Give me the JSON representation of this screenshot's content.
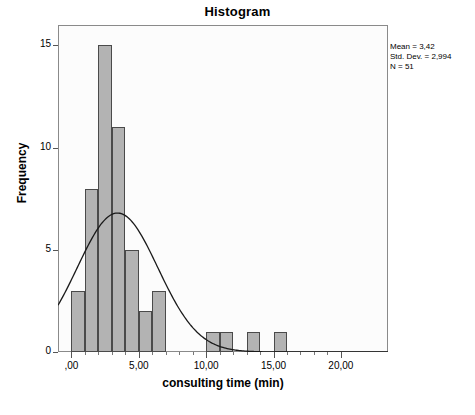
{
  "chart_data": {
    "type": "bar",
    "title": "Histogram",
    "xlabel": "consulting time (min)",
    "ylabel": "Frequency",
    "xlim": [
      -1.0,
      23.5
    ],
    "ylim": [
      0,
      16
    ],
    "grid": false,
    "bin_width": 1,
    "categories": [
      "0",
      "1",
      "2",
      "3",
      "4",
      "5",
      "6",
      "10",
      "11",
      "13",
      "15"
    ],
    "bins": [
      {
        "left": 0,
        "right": 1,
        "value": 3
      },
      {
        "left": 1,
        "right": 2,
        "value": 8
      },
      {
        "left": 2,
        "right": 3,
        "value": 15
      },
      {
        "left": 3,
        "right": 4,
        "value": 11
      },
      {
        "left": 4,
        "right": 5,
        "value": 5
      },
      {
        "left": 5,
        "right": 6,
        "value": 2
      },
      {
        "left": 6,
        "right": 7,
        "value": 3
      },
      {
        "left": 10,
        "right": 11,
        "value": 1
      },
      {
        "left": 11,
        "right": 12,
        "value": 1
      },
      {
        "left": 13,
        "right": 14,
        "value": 1
      },
      {
        "left": 15,
        "right": 16,
        "value": 1
      }
    ],
    "values": [
      3,
      8,
      15,
      11,
      5,
      2,
      3,
      1,
      1,
      1,
      1
    ],
    "xticks": [
      {
        "value": 0,
        "label": ",00"
      },
      {
        "value": 5,
        "label": "5,00"
      },
      {
        "value": 10,
        "label": "10,00"
      },
      {
        "value": 15,
        "label": "15,00"
      },
      {
        "value": 20,
        "label": "20,00"
      }
    ],
    "xminor_ticks": [
      1,
      2,
      3,
      4,
      6,
      7,
      8,
      9,
      11,
      12,
      13,
      14,
      16,
      17,
      18,
      19
    ],
    "yticks": [
      {
        "value": 0,
        "label": "0"
      },
      {
        "value": 5,
        "label": "5"
      },
      {
        "value": 10,
        "label": "10"
      },
      {
        "value": 15,
        "label": "15"
      }
    ],
    "normal_curve": {
      "mean": 3.42,
      "std_dev": 2.994,
      "n": 51,
      "peak_height": 6.8,
      "shown": true
    },
    "colors": {
      "bar_fill": "#b3b3b3",
      "bar_border": "#4a4a4a",
      "curve": "#1a1a1a",
      "plot_border": "#8a8a8a",
      "plot_background": "#fcfcfc"
    }
  },
  "stats": {
    "mean_line": "Mean = 3,42",
    "std_dev_line": "Std. Dev. = 2,994",
    "n_line": "N = 51"
  }
}
